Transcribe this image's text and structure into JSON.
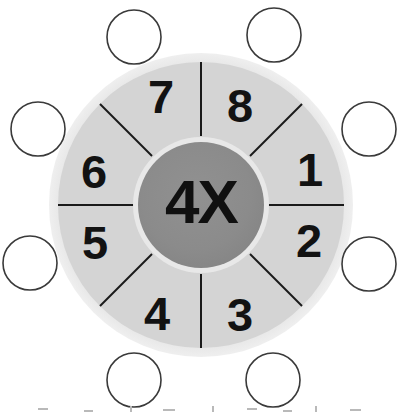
{
  "worksheet": {
    "title": "Multiplication Wheel",
    "hub": {
      "label": "4X",
      "operation": "multiply",
      "factor": "4",
      "fill_color": "#8a8a8a"
    },
    "wheel": {
      "center_x": 201,
      "center_y": 205,
      "outer_radius": 152,
      "rim_radius": 143,
      "hub_radius": 63,
      "ring_color": "#d4d4d4",
      "rim_color": "#e4e4e4",
      "divider_color": "#1a1a1a",
      "sector_count": 8
    },
    "sectors": [
      {
        "label": "1",
        "angle_deg": -67.5,
        "text_x": 310,
        "text_y": 186,
        "font_size": 47
      },
      {
        "label": "2",
        "angle_deg": -22.5,
        "text_x": 307,
        "text_y": 256,
        "font_size": 47
      },
      {
        "label": "3",
        "angle_deg": 22.5,
        "text_x": 240,
        "text_y": 330,
        "font_size": 47
      },
      {
        "label": "4",
        "angle_deg": 67.5,
        "text_x": 155,
        "text_y": 329,
        "font_size": 47
      },
      {
        "label": "5",
        "angle_deg": 112.5,
        "text_x": 93,
        "text_y": 258,
        "font_size": 47
      },
      {
        "label": "6",
        "angle_deg": 157.5,
        "text_x": 92,
        "text_y": 186,
        "font_size": 47
      },
      {
        "label": "7",
        "angle_deg": -157.5,
        "text_x": 160,
        "text_y": 112,
        "font_size": 47
      },
      {
        "label": "8",
        "angle_deg": -112.5,
        "text_x": 238,
        "text_y": 120,
        "font_size": 47
      }
    ],
    "answer_circles": [
      {
        "name": "answer-circle-top-left",
        "cx": 134,
        "cy": 37,
        "r": 27
      },
      {
        "name": "answer-circle-top-right",
        "cx": 274,
        "cy": 35,
        "r": 27
      },
      {
        "name": "answer-circle-left-upper",
        "cx": 38,
        "cy": 129,
        "r": 27
      },
      {
        "name": "answer-circle-right-upper",
        "cx": 369,
        "cy": 129,
        "r": 27
      },
      {
        "name": "answer-circle-left-lower",
        "cx": 30,
        "cy": 263,
        "r": 27
      },
      {
        "name": "answer-circle-right-lower",
        "cx": 369,
        "cy": 264,
        "r": 27
      },
      {
        "name": "answer-circle-bottom-left",
        "cx": 134,
        "cy": 380,
        "r": 27
      },
      {
        "name": "answer-circle-bottom-right",
        "cx": 273,
        "cy": 380,
        "r": 27
      }
    ],
    "scan_artifacts": [
      {
        "x": 38,
        "y": 408,
        "w": 10,
        "h": 2
      },
      {
        "x": 84,
        "y": 410,
        "w": 9,
        "h": 2
      },
      {
        "x": 130,
        "y": 406,
        "w": 2,
        "h": 6
      },
      {
        "x": 163,
        "y": 409,
        "w": 12,
        "h": 2
      },
      {
        "x": 212,
        "y": 406,
        "w": 2,
        "h": 6
      },
      {
        "x": 247,
        "y": 408,
        "w": 10,
        "h": 2
      },
      {
        "x": 283,
        "y": 410,
        "w": 9,
        "h": 2
      },
      {
        "x": 315,
        "y": 406,
        "w": 2,
        "h": 6
      },
      {
        "x": 350,
        "y": 409,
        "w": 11,
        "h": 2
      }
    ]
  }
}
